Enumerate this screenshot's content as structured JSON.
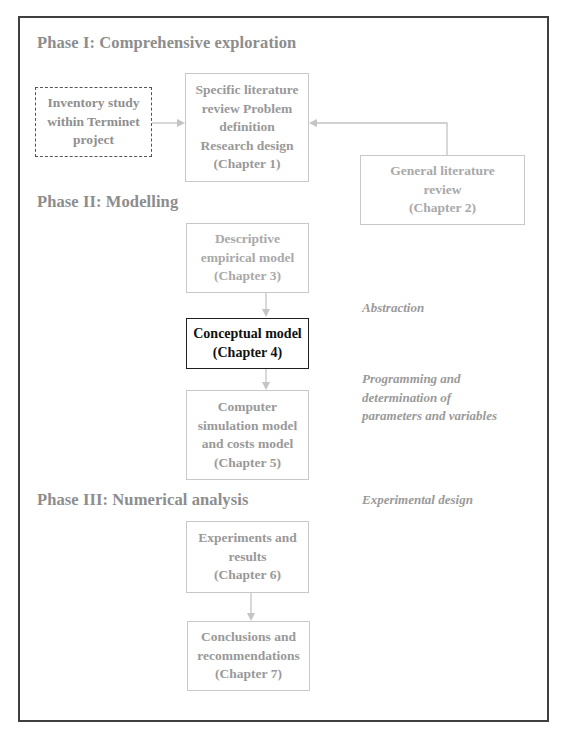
{
  "colors": {
    "frame": "#3f3f3f",
    "text_gray": "#8d8d8d",
    "box_border": "#c8c8c8",
    "highlight_border": "#1f1f1f",
    "arrow": "#c4c4c4"
  },
  "phases": [
    {
      "label": "Phase I: Comprehensive exploration"
    },
    {
      "label": "Phase II: Modelling"
    },
    {
      "label": "Phase III: Numerical analysis"
    }
  ],
  "boxes": {
    "inventory": {
      "lines": [
        "Inventory study",
        "within Terminet",
        "project"
      ]
    },
    "chapter1": {
      "lines": [
        "Specific literature",
        "review Problem",
        "definition",
        "Research design",
        "(Chapter 1)"
      ]
    },
    "chapter2": {
      "lines": [
        "General literature",
        "review",
        "(Chapter 2)"
      ]
    },
    "chapter3": {
      "lines": [
        "Descriptive",
        "empirical model",
        "(Chapter 3)"
      ]
    },
    "chapter4": {
      "lines": [
        "Conceptual model",
        "(Chapter 4)"
      ]
    },
    "chapter5": {
      "lines": [
        "Computer",
        "simulation model",
        "and costs model",
        "(Chapter 5)"
      ]
    },
    "chapter6": {
      "lines": [
        "Experiments and",
        "results",
        "(Chapter  6)"
      ]
    },
    "chapter7": {
      "lines": [
        "Conclusions and",
        "recommendations",
        "(Chapter 7)"
      ]
    }
  },
  "annotations": {
    "abstraction": [
      "Abstraction"
    ],
    "programming": [
      "Programming and",
      "determination of",
      "parameters and variables"
    ],
    "experimental": [
      "Experimental design"
    ]
  },
  "flows": [
    {
      "from": "inventory",
      "to": "chapter1"
    },
    {
      "from": "chapter2",
      "to": "chapter1"
    },
    {
      "from": "chapter3",
      "to": "chapter4"
    },
    {
      "from": "chapter4",
      "to": "chapter5"
    },
    {
      "from": "chapter6",
      "to": "chapter7"
    }
  ]
}
